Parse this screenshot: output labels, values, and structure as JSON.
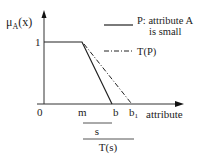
{
  "diagram": {
    "y_axis_label": "μ",
    "y_axis_sub": "A",
    "y_axis_arg": "(x)",
    "y_tick_1": "1",
    "origin": "0",
    "x_axis_label": "attribute",
    "x_ticks": {
      "m": "m",
      "b": "b",
      "b1": "b",
      "b1_sub": "1"
    },
    "legend": [
      {
        "style": "solid",
        "label_line1": "P: attribute A",
        "label_line2": "is small"
      },
      {
        "style": "dash-dot",
        "label_line1": "T(P)"
      }
    ],
    "brackets": {
      "s": "s",
      "Ts": "T(s)"
    },
    "colors": {
      "line": "#222222",
      "background": "#ffffff"
    }
  }
}
